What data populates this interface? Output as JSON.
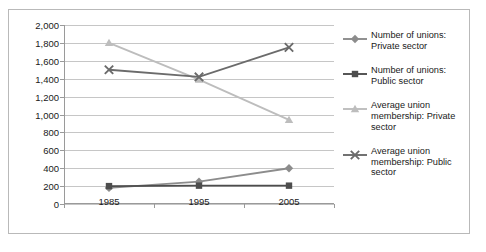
{
  "chart_data": {
    "type": "line",
    "title": "",
    "xlabel": "",
    "ylabel": "",
    "categories": [
      "1985",
      "1995",
      "2005"
    ],
    "ylim": [
      0,
      2000
    ],
    "ytick_step": 200,
    "ytick_labels": [
      "2,000",
      "1,800",
      "1,600",
      "1,400",
      "1,200",
      "1,000",
      "800",
      "600",
      "400",
      "200",
      "0"
    ],
    "grid": true,
    "legend_position": "right",
    "series": [
      {
        "name": "Number of unions: Private sector",
        "marker": "diamond",
        "color": "#8c8c8c",
        "values": [
          180,
          250,
          400
        ]
      },
      {
        "name": "Number of unions: Public sector",
        "marker": "square",
        "color": "#4d4d4d",
        "values": [
          200,
          205,
          205
        ]
      },
      {
        "name": "Average union membership: Private sector",
        "marker": "triangle",
        "color": "#bdbdbd",
        "values": [
          1800,
          1390,
          940
        ]
      },
      {
        "name": "Average union membership: Public sector",
        "marker": "cross",
        "color": "#6b6b6b",
        "values": [
          1500,
          1420,
          1750
        ]
      }
    ]
  },
  "legend": {
    "items": [
      {
        "label": "Number of unions: Private sector",
        "marker": "diamond-marker-icon",
        "color": "#8c8c8c"
      },
      {
        "label": "Number of unions: Public sector",
        "marker": "square-marker-icon",
        "color": "#4d4d4d"
      },
      {
        "label": "Average union membership: Private sector",
        "marker": "triangle-marker-icon",
        "color": "#bdbdbd"
      },
      {
        "label": "Average union membership: Public sector",
        "marker": "cross-marker-icon",
        "color": "#6b6b6b"
      }
    ]
  }
}
